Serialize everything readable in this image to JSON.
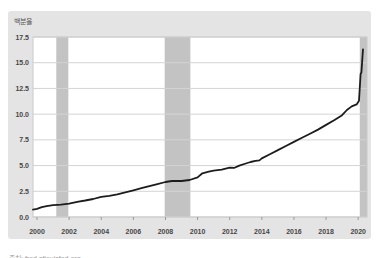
{
  "panel": {
    "background": "#e4e4e4",
    "plot_background": "#ffffff",
    "border_color": "#c9c9c9"
  },
  "chart_data": {
    "type": "line",
    "title": "",
    "xlabel": "",
    "ylabel": "백분율",
    "ylim": [
      0,
      17.5
    ],
    "yticks": [
      0,
      2.5,
      5,
      7.5,
      10,
      12.5,
      15,
      17.5
    ],
    "ytick_format": "one-decimal",
    "xlim": [
      1999.75,
      2020.55
    ],
    "xticks": [
      2000,
      2002,
      2004,
      2006,
      2008,
      2010,
      2012,
      2014,
      2016,
      2018,
      2020
    ],
    "grid": true,
    "gridline_color": "#d4d4d4",
    "legend_position": "none",
    "line_color": "#1c1c1c",
    "line_width": 1.8,
    "recession_band_color": "#c3c3c3",
    "recession_bands": [
      [
        2001.2,
        2001.95
      ],
      [
        2007.95,
        2009.55
      ],
      [
        2020.1,
        2020.55
      ]
    ],
    "series": [
      {
        "name": "value",
        "points": [
          [
            1999.75,
            0.72
          ],
          [
            2000,
            0.8
          ],
          [
            2000.3,
            0.95
          ],
          [
            2000.6,
            1.05
          ],
          [
            2001,
            1.15
          ],
          [
            2001.5,
            1.2
          ],
          [
            2002,
            1.3
          ],
          [
            2002.5,
            1.48
          ],
          [
            2003,
            1.6
          ],
          [
            2003.5,
            1.75
          ],
          [
            2004,
            1.95
          ],
          [
            2004.5,
            2.05
          ],
          [
            2005,
            2.2
          ],
          [
            2005.5,
            2.4
          ],
          [
            2006,
            2.6
          ],
          [
            2006.5,
            2.8
          ],
          [
            2007,
            3.0
          ],
          [
            2007.5,
            3.2
          ],
          [
            2008,
            3.4
          ],
          [
            2008.4,
            3.5
          ],
          [
            2009,
            3.5
          ],
          [
            2009.5,
            3.6
          ],
          [
            2010,
            3.85
          ],
          [
            2010.3,
            4.25
          ],
          [
            2010.7,
            4.4
          ],
          [
            2011,
            4.5
          ],
          [
            2011.5,
            4.6
          ],
          [
            2012,
            4.8
          ],
          [
            2012.3,
            4.78
          ],
          [
            2012.6,
            5.0
          ],
          [
            2013,
            5.2
          ],
          [
            2013.3,
            5.35
          ],
          [
            2013.6,
            5.45
          ],
          [
            2013.85,
            5.5
          ],
          [
            2014,
            5.7
          ],
          [
            2014.5,
            6.1
          ],
          [
            2015,
            6.5
          ],
          [
            2015.5,
            6.9
          ],
          [
            2016,
            7.3
          ],
          [
            2016.5,
            7.7
          ],
          [
            2017,
            8.1
          ],
          [
            2017.5,
            8.5
          ],
          [
            2018,
            8.95
          ],
          [
            2018.5,
            9.4
          ],
          [
            2019,
            9.9
          ],
          [
            2019.3,
            10.4
          ],
          [
            2019.6,
            10.75
          ],
          [
            2019.9,
            10.95
          ],
          [
            2020.05,
            11.3
          ],
          [
            2020.15,
            13.9
          ],
          [
            2020.2,
            14.05
          ],
          [
            2020.3,
            16.3
          ]
        ]
      }
    ]
  },
  "caption": {
    "text": "출처: fred.stlouisfed.org"
  }
}
